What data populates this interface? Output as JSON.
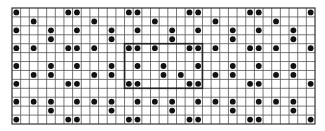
{
  "diagram": {
    "type": "dot-grid-pattern",
    "rows": 13,
    "cols": 35,
    "colors": {
      "background": "#ffffff",
      "grid_line": "#555555",
      "border": "#333333",
      "dot": "#111111",
      "highlight_box": "#222222"
    },
    "dots_by_row": [
      [
        1,
        7,
        8,
        14,
        15,
        21,
        22,
        28,
        29,
        35
      ],
      [
        3,
        10,
        17,
        24,
        31
      ],
      [
        1,
        5,
        8,
        12,
        15,
        19,
        22,
        26,
        29,
        33
      ],
      [
        5,
        12,
        19,
        26,
        33
      ],
      [
        1,
        3,
        7,
        8,
        10,
        14,
        15,
        17,
        21,
        22,
        24,
        28,
        29,
        31,
        35
      ],
      [],
      [
        1,
        5,
        8,
        12,
        15,
        18,
        22,
        26,
        29,
        33
      ],
      [
        3,
        5,
        10,
        12,
        18,
        20,
        24,
        26,
        31,
        33
      ],
      [
        1,
        7,
        8,
        14,
        15,
        21,
        22,
        28,
        29,
        35
      ],
      [],
      [
        1,
        3,
        5,
        8,
        10,
        12,
        15,
        17,
        19,
        22,
        24,
        26,
        29,
        31,
        33
      ],
      [
        5,
        12,
        19,
        26,
        33
      ],
      [
        1,
        7,
        8,
        14,
        15,
        21,
        22,
        28,
        29,
        35
      ]
    ],
    "highlight_box": {
      "row_start": 5,
      "row_end": 9,
      "col_start": 14,
      "col_end": 22
    }
  }
}
